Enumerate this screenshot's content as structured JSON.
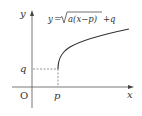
{
  "diagram": {
    "type": "function-graph",
    "equation": {
      "lhs": "y",
      "eq": "=",
      "radicand": "a(x−p)",
      "tail": "+q"
    },
    "axes": {
      "x_label": "x",
      "y_label": "y",
      "origin_label": "O"
    },
    "marks": {
      "p_label": "p",
      "q_label": "q"
    },
    "colors": {
      "axis": "#555555",
      "curve": "#333333",
      "dashed": "#666666"
    }
  }
}
